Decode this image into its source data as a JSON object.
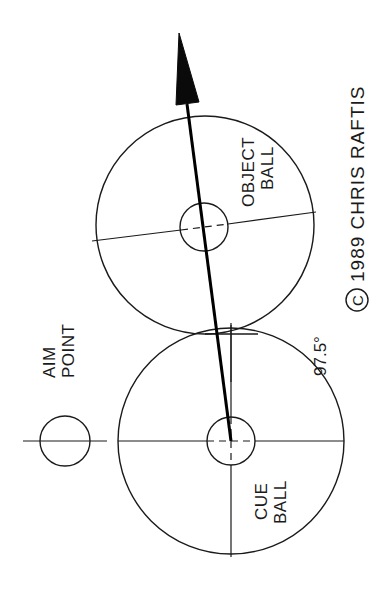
{
  "diagram": {
    "labels": {
      "aim_point_line1": "AIM",
      "aim_point_line2": "POINT",
      "cue_ball_line1": "CUE",
      "cue_ball_line2": "BALL",
      "object_ball_line1": "OBJECT",
      "object_ball_line2": "BALL",
      "angle": "97.5°",
      "copyright_symbol": "C",
      "copyright_text": "1989  CHRIS  RAFTIS"
    },
    "colors": {
      "stroke": "#1a1a1a",
      "background": "#ffffff",
      "arrow": "#0a0a0a"
    }
  }
}
